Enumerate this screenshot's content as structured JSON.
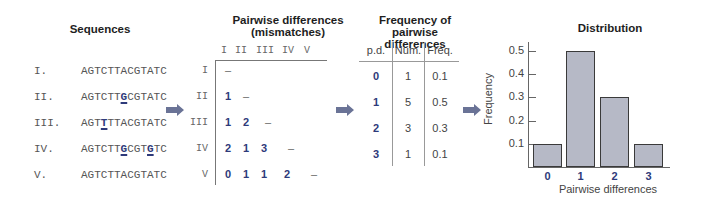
{
  "sequences": {
    "title": "Sequences",
    "rows": [
      {
        "label": "I.",
        "pre": "AGTCTTACGTATC",
        "hl": "",
        "post": "",
        "hl2": "",
        "post2": ""
      },
      {
        "label": "II.",
        "pre": "AGTCTT",
        "hl": "G",
        "post": "CGTATC",
        "hl2": "",
        "post2": ""
      },
      {
        "label": "III.",
        "pre": "AGT",
        "hl": "T",
        "post": "TTACGTATC",
        "hl2": "",
        "post2": ""
      },
      {
        "label": "IV.",
        "pre": "AGTCTT",
        "hl": "G",
        "post": "CGT",
        "hl2": "G",
        "post2": "TC"
      },
      {
        "label": "V.",
        "pre": "AGTCTTACGTATC",
        "hl": "",
        "post": "",
        "hl2": "",
        "post2": ""
      }
    ]
  },
  "pairwise": {
    "title_line1": "Pairwise differences",
    "title_line2": "(mismatches)",
    "col_labels": [
      "I",
      "II",
      "III",
      "IV",
      "V"
    ],
    "row_labels": [
      "I",
      "II",
      "III",
      "IV",
      "V"
    ],
    "dash": "–",
    "matrix": [
      [],
      [
        "1"
      ],
      [
        "1",
        "2"
      ],
      [
        "2",
        "1",
        "3"
      ],
      [
        "0",
        "1",
        "1",
        "2"
      ]
    ]
  },
  "frequency_table": {
    "title_line1": "Frequency of pairwise",
    "title_line2": "differences",
    "headers": [
      "p.d.",
      "Num.",
      "Freq."
    ],
    "rows": [
      {
        "pd": "0",
        "num": "1",
        "freq": "0.1"
      },
      {
        "pd": "1",
        "num": "5",
        "freq": "0.5"
      },
      {
        "pd": "2",
        "num": "3",
        "freq": "0.3"
      },
      {
        "pd": "3",
        "num": "1",
        "freq": "0.1"
      }
    ]
  },
  "chart_data": {
    "type": "bar",
    "title": "Distribution",
    "xlabel": "Pairwise differences",
    "ylabel": "Frequency",
    "categories": [
      "0",
      "1",
      "2",
      "3"
    ],
    "values": [
      0.1,
      0.5,
      0.3,
      0.1
    ],
    "yticks": [
      "0.1",
      "0.2",
      "0.3",
      "0.4",
      "0.5"
    ],
    "ylim": [
      0,
      0.5
    ],
    "grid": false,
    "legend": null,
    "bar_color": "#b6b9c6"
  },
  "colors": {
    "accent": "#2e3a7a",
    "arrow": "#6a7396"
  }
}
